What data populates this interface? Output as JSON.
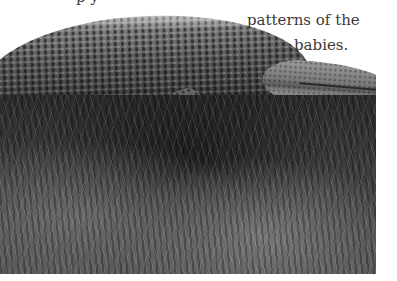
{
  "page": {
    "text_lines": [
      "p                                                                     y",
      "patterns of the",
      "babies."
    ]
  },
  "photo": {
    "subject": "saltwater crocodile lying in grass",
    "style": "grayscale photograph"
  }
}
